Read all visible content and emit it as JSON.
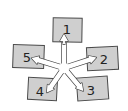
{
  "diagram": {
    "type": "radial-flow",
    "center": {
      "x": 64,
      "y": 68,
      "face": "smiley"
    },
    "colors": {
      "box_fill": "#cfcfcf",
      "box_stroke": "#4a4a4a",
      "arrow_fill": "#ffffff",
      "arrow_stroke": "#4a4a4a",
      "text": "#222222",
      "background": "#ffffff"
    },
    "boxes": [
      {
        "label": "1",
        "x": 53,
        "y": 18,
        "w": 29,
        "h": 24,
        "rot": 1,
        "tx": 67,
        "ty": 34
      },
      {
        "label": "2",
        "x": 87,
        "y": 47,
        "w": 31,
        "h": 23,
        "rot": -3,
        "tx": 104,
        "ty": 64
      },
      {
        "label": "3",
        "x": 77,
        "y": 77,
        "w": 31,
        "h": 23,
        "rot": -4,
        "tx": 91,
        "ty": 95
      },
      {
        "label": "4",
        "x": 28,
        "y": 78,
        "w": 29,
        "h": 22,
        "rot": 3,
        "tx": 40,
        "ty": 96
      },
      {
        "label": "5",
        "x": 13,
        "y": 45,
        "w": 31,
        "h": 23,
        "rot": 2,
        "tx": 27,
        "ty": 62
      }
    ],
    "arrows": [
      {
        "to": "1",
        "angle": -90,
        "length": 34
      },
      {
        "to": "2",
        "angle": -18,
        "length": 34
      },
      {
        "to": "3",
        "angle": 50,
        "length": 30
      },
      {
        "to": "4",
        "angle": 125,
        "length": 30
      },
      {
        "to": "5",
        "angle": 197,
        "length": 34
      }
    ]
  }
}
